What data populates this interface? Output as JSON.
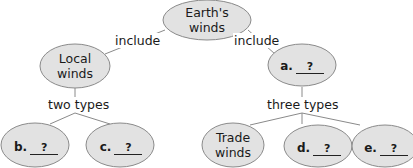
{
  "diagram": {
    "type": "concept-map",
    "colors": {
      "ellipse_fill": "#e2e2e2",
      "ellipse_stroke": "#8a8a8a",
      "line": "#8a8a8a"
    },
    "root": {
      "label": "Earth's winds"
    },
    "links": {
      "include_left": "include",
      "include_right": "include",
      "two_types": "two types",
      "three_types": "three types"
    },
    "local": {
      "label": "Local winds"
    },
    "a": {
      "letter": "a.",
      "answer": "?"
    },
    "b": {
      "letter": "b.",
      "answer": "?"
    },
    "c": {
      "letter": "c.",
      "answer": "?"
    },
    "trade": {
      "label": "Trade winds"
    },
    "d": {
      "letter": "d.",
      "answer": "?"
    },
    "e": {
      "letter": "e.",
      "answer": "?"
    }
  }
}
